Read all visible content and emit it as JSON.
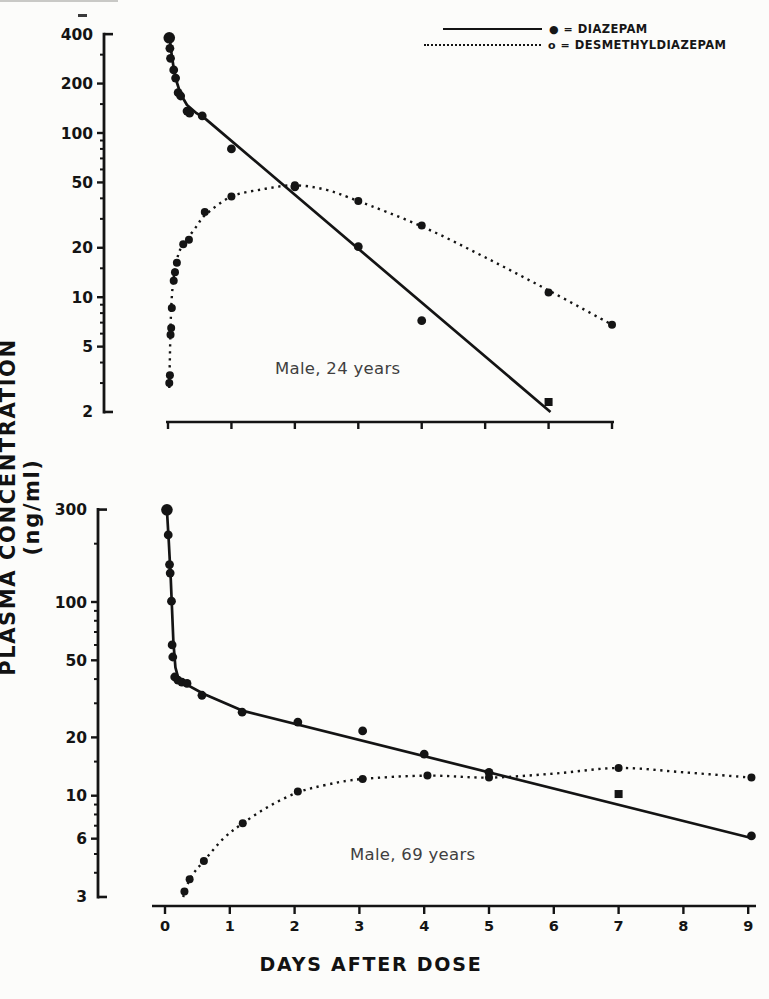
{
  "page": {
    "background": "#fcfcfa",
    "ink": "#141414",
    "annotation_color": "#3f3f3f"
  },
  "y_axis_title": "PLASMA CONCENTRATION (ng/ml)",
  "x_axis_title": "DAYS AFTER DOSE",
  "legend": {
    "items": [
      {
        "marker": "●",
        "separator": "=",
        "label": "DIAZEPAM",
        "line_style": "solid"
      },
      {
        "marker": "o",
        "separator": "=",
        "label": "DESMETHYLDIAZEPAM",
        "line_style": "dotted"
      }
    ]
  },
  "chart_data": [
    {
      "type": "line",
      "annotation": "Male, 24 years",
      "xlabel": "DAYS AFTER DOSE",
      "ylabel": "PLASMA CONCENTRATION (ng/ml)",
      "x_range": [
        0,
        7
      ],
      "x_ticks": [
        0,
        1,
        2,
        3,
        4,
        5,
        6,
        7
      ],
      "x_tick_labels_visible": false,
      "y_scale": "log",
      "y_range": [
        2,
        400
      ],
      "y_major_ticks": [
        400,
        200,
        100,
        50,
        20,
        10,
        5,
        2
      ],
      "y_minor_ticks": [
        300,
        150,
        90,
        80,
        70,
        60,
        40,
        30,
        15,
        9,
        8,
        7,
        6,
        4,
        3
      ],
      "series": [
        {
          "name": "diazepam",
          "line_style": "solid",
          "marker": "filled-circle",
          "points": [
            [
              0.02,
              380,
              "big"
            ],
            [
              0.03,
              328
            ],
            [
              0.04,
              285
            ],
            [
              0.09,
              242
            ],
            [
              0.12,
              216
            ],
            [
              0.16,
              176
            ],
            [
              0.2,
              168
            ],
            [
              0.3,
              136
            ],
            [
              0.34,
              132
            ],
            [
              0.54,
              127
            ],
            [
              1.0,
              80
            ],
            [
              2.0,
              47
            ],
            [
              3.0,
              20.3
            ],
            [
              4.0,
              7.2
            ],
            [
              6.0,
              2.3,
              "sq"
            ]
          ],
          "trend": [
            [
              0.02,
              395
            ],
            [
              0.05,
              315
            ],
            [
              0.09,
              248
            ],
            [
              0.14,
              203
            ],
            [
              0.2,
              172
            ],
            [
              0.3,
              148
            ],
            [
              0.45,
              132
            ],
            [
              0.6,
              121
            ],
            [
              6.03,
              2.0
            ]
          ]
        },
        {
          "name": "desmethyldiazepam",
          "line_style": "dotted",
          "marker": "filled-circle",
          "points": [
            [
              0.02,
              3.0
            ],
            [
              0.03,
              3.35
            ],
            [
              0.04,
              5.9
            ],
            [
              0.05,
              6.5
            ],
            [
              0.06,
              8.6
            ],
            [
              0.09,
              12.6
            ],
            [
              0.11,
              14.2
            ],
            [
              0.14,
              16.2
            ],
            [
              0.24,
              21
            ],
            [
              0.33,
              22.4
            ],
            [
              0.58,
              33
            ],
            [
              1.0,
              41
            ],
            [
              2.0,
              48
            ],
            [
              3.0,
              38.5
            ],
            [
              4.0,
              27.3
            ],
            [
              6.0,
              10.7
            ],
            [
              7.0,
              6.8
            ]
          ],
          "trend": [
            [
              0.02,
              2.8
            ],
            [
              0.05,
              8.5
            ],
            [
              0.1,
              14
            ],
            [
              0.18,
              19
            ],
            [
              0.3,
              22.5
            ],
            [
              0.45,
              27
            ],
            [
              0.6,
              32
            ],
            [
              1.0,
              41
            ],
            [
              1.5,
              45.5
            ],
            [
              2.0,
              48
            ],
            [
              2.5,
              45
            ],
            [
              3.0,
              38.5
            ],
            [
              4.0,
              27
            ],
            [
              5.0,
              17.5
            ],
            [
              6.0,
              11
            ],
            [
              7.0,
              6.8
            ]
          ]
        }
      ]
    },
    {
      "type": "line",
      "annotation": "Male, 69 years",
      "xlabel": "DAYS AFTER DOSE",
      "ylabel": "PLASMA CONCENTRATION (ng/ml)",
      "x_range": [
        0,
        9
      ],
      "x_ticks": [
        0,
        1,
        2,
        3,
        4,
        5,
        6,
        7,
        8,
        9
      ],
      "x_tick_labels_visible": true,
      "y_scale": "log",
      "y_range": [
        3,
        300
      ],
      "y_major_ticks": [
        300,
        100,
        50,
        20,
        10,
        6,
        3
      ],
      "y_minor_ticks": [
        200,
        90,
        80,
        70,
        60,
        40,
        30,
        15,
        9,
        8,
        7,
        5,
        4
      ],
      "series": [
        {
          "name": "diazepam",
          "line_style": "solid",
          "marker": "filled-circle",
          "points": [
            [
              0.03,
              299,
              "big"
            ],
            [
              0.05,
              222
            ],
            [
              0.07,
              156
            ],
            [
              0.08,
              141
            ],
            [
              0.1,
              101
            ],
            [
              0.11,
              60
            ],
            [
              0.12,
              52
            ],
            [
              0.15,
              41
            ],
            [
              0.2,
              39.5
            ],
            [
              0.26,
              38.6
            ],
            [
              0.34,
              38
            ],
            [
              0.57,
              33
            ],
            [
              1.19,
              27
            ],
            [
              2.05,
              24
            ],
            [
              3.05,
              21.6
            ],
            [
              4.0,
              16.4
            ],
            [
              5.0,
              13.2
            ],
            [
              7.0,
              10.2,
              "sq"
            ],
            [
              9.05,
              6.2
            ]
          ],
          "trend": [
            [
              0.03,
              300
            ],
            [
              0.06,
              200
            ],
            [
              0.09,
              130
            ],
            [
              0.11,
              90
            ],
            [
              0.13,
              62
            ],
            [
              0.16,
              46
            ],
            [
              0.2,
              41
            ],
            [
              0.3,
              38
            ],
            [
              0.6,
              33.5
            ],
            [
              1.19,
              27.5
            ],
            [
              9.05,
              6.05
            ]
          ]
        },
        {
          "name": "desmethyldiazepam",
          "line_style": "dotted",
          "marker": "filled-circle",
          "points": [
            [
              0.3,
              3.2
            ],
            [
              0.38,
              3.7
            ],
            [
              0.6,
              4.6
            ],
            [
              1.2,
              7.2
            ],
            [
              2.05,
              10.5
            ],
            [
              3.05,
              12.2
            ],
            [
              4.05,
              12.7
            ],
            [
              5.0,
              12.4
            ],
            [
              7.0,
              13.9
            ],
            [
              9.05,
              12.4
            ]
          ],
          "trend": [
            [
              0.28,
              3.0
            ],
            [
              0.4,
              3.8
            ],
            [
              0.6,
              4.6
            ],
            [
              0.9,
              6.0
            ],
            [
              1.2,
              7.2
            ],
            [
              1.6,
              8.8
            ],
            [
              2.05,
              10.4
            ],
            [
              2.5,
              11.4
            ],
            [
              3.05,
              12.2
            ],
            [
              4.05,
              12.7
            ],
            [
              5.0,
              12.4
            ],
            [
              6.0,
              13.0
            ],
            [
              7.0,
              13.9
            ],
            [
              8.0,
              13.2
            ],
            [
              9.05,
              12.4
            ]
          ]
        }
      ]
    }
  ]
}
